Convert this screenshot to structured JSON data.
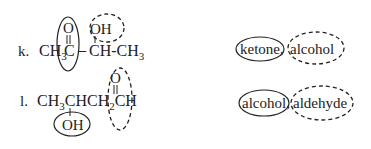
{
  "problems": [
    {
      "label": "k.",
      "formula": {
        "main_left": "CH",
        "main_left_sub": "3",
        "carbonyl_c": "C",
        "dash": "–",
        "ch": "CH-CH",
        "ch_sub": "3",
        "carbonyl_o": "O",
        "hydroxyl": "OH"
      },
      "answer": {
        "solid_circled": "ketone,",
        "dashed_circled": "alcohol"
      }
    },
    {
      "label": "l.",
      "formula": {
        "main": "CH",
        "sub1": "3",
        "mid": "CHCH",
        "sub2": "2",
        "end": "CH",
        "carbonyl_o": "O",
        "hydroxyl": "OH"
      },
      "answer": {
        "solid_circled": "alcohol,",
        "dashed_circled": "aldehyde"
      }
    }
  ],
  "legend": {
    "solid_style": "solid ellipse",
    "dashed_style": "dashed ellipse"
  }
}
